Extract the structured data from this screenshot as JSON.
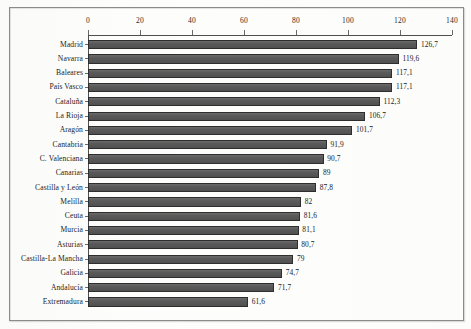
{
  "figure": {
    "frame_color": "#8b8b8b",
    "background": "#fdfdfc",
    "bar_color": "#5c5c5c",
    "axis_color": "#4f4f4f"
  },
  "chart_data": {
    "type": "bar",
    "orientation": "horizontal",
    "title": "",
    "subtitle": "",
    "xlabel": "",
    "ylabel": "",
    "xlim": [
      0,
      140
    ],
    "xticks": [
      0,
      20,
      40,
      60,
      80,
      100,
      120,
      140
    ],
    "xtick_labels": [
      "0",
      "20",
      "40",
      "60",
      "80",
      "100",
      "120",
      "140"
    ],
    "grid": false,
    "legend": null,
    "axis_position": "top",
    "data_labels": true,
    "decimal_separator": ",",
    "categories": [
      "Madrid",
      "Navarra",
      "Baleares",
      "País Vasco",
      "Cataluña",
      "La Rioja",
      "Aragón",
      "Cantabria",
      "C. Valenciana",
      "Canarias",
      "Castilla y León",
      "Melilla",
      "Ceuta",
      "Murcia",
      "Asturias",
      "Castilla-La Mancha",
      "Galicia",
      "Andalucía",
      "Extremadura"
    ],
    "values": [
      126.7,
      119.6,
      117.1,
      117.1,
      112.3,
      106.7,
      101.7,
      91.9,
      90.7,
      89,
      87.8,
      82,
      81.6,
      81.1,
      80.7,
      79,
      74.7,
      71.7,
      61.6
    ],
    "value_labels": [
      "126,7",
      "119,6",
      "117,1",
      "117,1",
      "112,3",
      "106,7",
      "101,7",
      "91,9",
      "90,7",
      "89",
      "87,8",
      "82",
      "81,6",
      "81,1",
      "80,7",
      "79",
      "74,7",
      "71,7",
      "61,6"
    ]
  }
}
